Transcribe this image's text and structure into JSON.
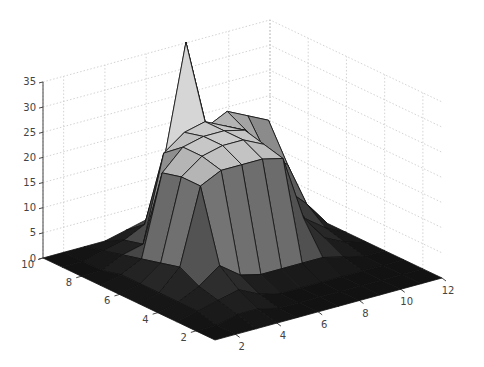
{
  "chart_data": {
    "type": "surface3d",
    "title": "",
    "xlabel": "",
    "ylabel": "",
    "zlabel": "",
    "x_ticks": [
      2,
      4,
      6,
      8,
      10,
      12
    ],
    "y_ticks": [
      2,
      4,
      6,
      8,
      10
    ],
    "z_ticks": [
      0,
      5,
      10,
      15,
      20,
      25,
      30,
      35
    ],
    "xlim": [
      1,
      12
    ],
    "ylim": [
      1,
      10
    ],
    "zlim": [
      0,
      35
    ],
    "grid": true,
    "colormap": "gray",
    "x": [
      1,
      2,
      3,
      4,
      5,
      6,
      7,
      8,
      9,
      10,
      11,
      12
    ],
    "y": [
      1,
      2,
      3,
      4,
      5,
      6,
      7,
      8,
      9,
      10
    ],
    "z": [
      [
        0,
        0,
        0,
        0,
        0,
        0,
        0,
        0,
        0,
        0,
        0,
        0
      ],
      [
        0,
        0,
        1,
        1,
        0,
        0,
        0,
        0,
        0,
        0,
        0,
        0
      ],
      [
        0,
        1,
        2,
        3,
        1,
        0,
        0,
        0,
        0,
        0,
        0,
        0
      ],
      [
        0,
        1,
        3,
        6,
        3,
        2,
        2,
        2,
        2,
        1,
        0,
        0
      ],
      [
        0,
        1,
        5,
        20,
        22,
        22,
        22,
        21,
        8,
        3,
        1,
        0
      ],
      [
        0,
        1,
        4,
        20,
        23,
        24,
        24,
        22,
        10,
        5,
        2,
        0
      ],
      [
        0,
        1,
        3,
        19,
        23,
        24,
        24,
        23,
        14,
        9,
        5,
        0
      ],
      [
        0,
        0,
        2,
        3,
        20,
        23,
        24,
        22,
        20,
        14,
        11,
        0
      ],
      [
        0,
        0,
        1,
        2,
        4,
        17,
        38,
        20,
        22,
        20,
        18,
        0
      ],
      [
        0,
        0,
        0,
        0,
        1,
        2,
        4,
        3,
        2,
        1,
        0,
        0
      ]
    ]
  },
  "axes": {
    "z_tick_labels": [
      "0",
      "5",
      "10",
      "15",
      "20",
      "25",
      "30",
      "35"
    ],
    "y_tick_labels": [
      "2",
      "4",
      "6",
      "8",
      "10"
    ],
    "x_tick_labels": [
      "2",
      "4",
      "6",
      "8",
      "10",
      "12"
    ]
  }
}
